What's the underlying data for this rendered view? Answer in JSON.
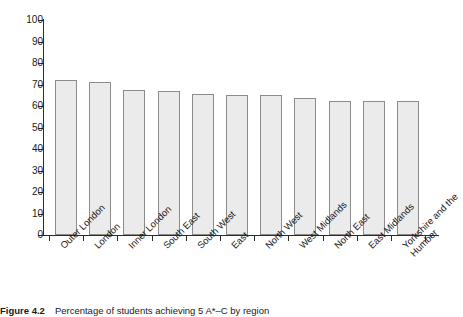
{
  "caption": {
    "label": "Figure 4.2",
    "text": "Percentage of students achieving 5 A*–C by region"
  },
  "chart_data": {
    "type": "bar",
    "title": "",
    "xlabel": "",
    "ylabel": "",
    "ylim": [
      0,
      100
    ],
    "ytick_step": 10,
    "grid": false,
    "legend": null,
    "yticks": [
      "100",
      "90",
      "80",
      "70",
      "60",
      "50",
      "40",
      "30",
      "20",
      "10",
      "0"
    ],
    "categories": [
      "Outer London",
      "London",
      "Inner London",
      "South East",
      "South West",
      "East",
      "North West",
      "West Midlands",
      "North East",
      "East Midlands",
      "Yorkshire and the Humber"
    ],
    "values": [
      72,
      71,
      67.5,
      67,
      65.5,
      65,
      65,
      63.5,
      62.5,
      62.5,
      62.5
    ],
    "bar_fill": "#ebebeb",
    "bar_edge": "#8c8c8c",
    "axis_color": "#2b2b2b"
  }
}
